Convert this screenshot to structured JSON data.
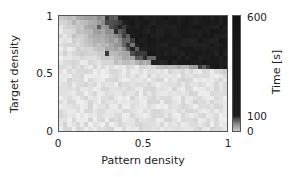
{
  "chart_data": {
    "type": "heatmap",
    "title": "",
    "xlabel": "Pattern density",
    "ylabel": "Target density",
    "xlim": [
      0,
      1
    ],
    "ylim": [
      0,
      1
    ],
    "x_ticks": [
      "0",
      "0.5",
      "1"
    ],
    "y_ticks": [
      "0",
      "0.5",
      "1"
    ],
    "grid": false,
    "grid_size": {
      "cols": 40,
      "rows": 26
    },
    "colorbar": {
      "label": "Time [s]",
      "ticks": [
        "0",
        "100",
        "600"
      ],
      "range": [
        0,
        600
      ],
      "colormap": "gray_r (white = 0 s, black = 600 s)"
    },
    "boundary": [
      {
        "target_density": 1.0,
        "pattern_density_threshold": 0.28
      },
      {
        "target_density": 0.9,
        "pattern_density_threshold": 0.33
      },
      {
        "target_density": 0.8,
        "pattern_density_threshold": 0.38
      },
      {
        "target_density": 0.7,
        "pattern_density_threshold": 0.42
      },
      {
        "target_density": 0.6,
        "pattern_density_threshold": 0.55
      },
      {
        "target_density": 0.55,
        "pattern_density_threshold": 0.9
      },
      {
        "target_density": 0.5,
        "pattern_density_threshold": 1.5
      }
    ],
    "low_region_value_s": 5,
    "high_region_value_s": 600
  },
  "labels": {
    "xlabel": "Pattern density",
    "ylabel": "Target density",
    "colorbar_label": "Time [s]",
    "x0": "0",
    "x05": "0.5",
    "x1": "1",
    "y0": "0",
    "y05": "0.5",
    "y1": "1",
    "c0": "0",
    "c100": "100",
    "c600": "600"
  }
}
